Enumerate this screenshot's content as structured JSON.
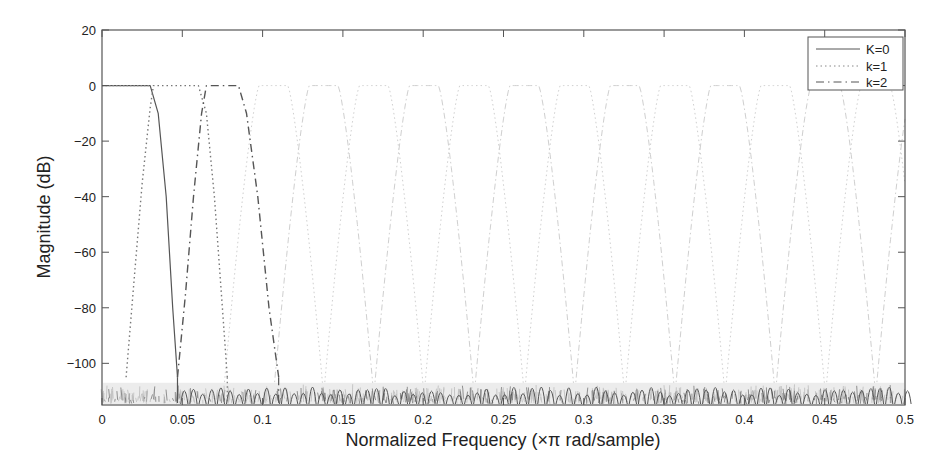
{
  "chart_data": {
    "type": "line",
    "title": "",
    "xlabel": "Normalized Frequency (×π rad/sample)",
    "ylabel": "Magnitude (dB)",
    "xlim": [
      0,
      0.5
    ],
    "ylim": [
      -115,
      20
    ],
    "grid": false,
    "legend_position": "upper right",
    "x_ticks": [
      0,
      0.05,
      0.1,
      0.15,
      0.2,
      0.25,
      0.3,
      0.35,
      0.4,
      0.45,
      0.5
    ],
    "x_tick_labels": [
      "0",
      "0.05",
      "0.1",
      "0.15",
      "0.2",
      "0.25",
      "0.3",
      "0.35",
      "0.4",
      "0.45",
      "0.5"
    ],
    "y_ticks": [
      20,
      0,
      -20,
      -40,
      -60,
      -80,
      -100
    ],
    "y_tick_labels": [
      "20",
      "0",
      "−20",
      "−40",
      "−60",
      "−80",
      "−100"
    ],
    "channel_spacing": 0.03125,
    "stopband_floor_db": -110,
    "series": [
      {
        "name": "K=0",
        "style": "solid",
        "color": "#555555",
        "passband": [
          0,
          0.03
        ],
        "transition_end": 0.047,
        "x": [
          0,
          0.01,
          0.02,
          0.03,
          0.035,
          0.04,
          0.044,
          0.047
        ],
        "y": [
          0,
          0,
          0,
          0,
          -10,
          -40,
          -80,
          -105
        ]
      },
      {
        "name": "k=1",
        "style": "dotted",
        "color": "#777777",
        "passband": [
          0.032,
          0.06
        ],
        "x": [
          0.015,
          0.02,
          0.025,
          0.03,
          0.032,
          0.06,
          0.065,
          0.07,
          0.075,
          0.078
        ],
        "y": [
          -105,
          -70,
          -35,
          -8,
          0,
          0,
          -10,
          -40,
          -80,
          -105
        ]
      },
      {
        "name": "k=2",
        "style": "dashdot",
        "color": "#555555",
        "passband": [
          0.065,
          0.085
        ],
        "x": [
          0.047,
          0.052,
          0.057,
          0.062,
          0.065,
          0.085,
          0.09,
          0.097,
          0.104,
          0.11
        ],
        "y": [
          -105,
          -75,
          -40,
          -10,
          0,
          0,
          -10,
          -40,
          -80,
          -105
        ]
      }
    ]
  },
  "legend": {
    "items": [
      {
        "label": "K=0",
        "style": "solid"
      },
      {
        "label": "k=1",
        "style": "dotted"
      },
      {
        "label": "k=2",
        "style": "dashdot"
      }
    ]
  },
  "axes": {
    "xlabel": "Normalized Frequency (×π rad/sample)",
    "ylabel": "Magnitude (dB)"
  }
}
